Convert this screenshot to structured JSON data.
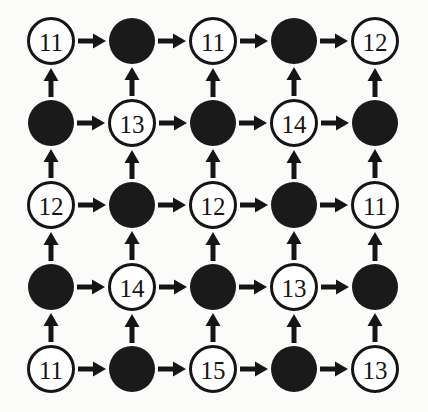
{
  "diagram": {
    "type": "directed-grid-graph",
    "rows": 5,
    "cols": 5,
    "background_color": "#fbfbfa",
    "node_fill_empty_color": "#ffffff",
    "node_fill_filled_color": "#1a1a1a",
    "node_stroke_color": "#151515",
    "arrow_color": "#151515",
    "label_color": "#151515",
    "node_radius": 24,
    "filled_node_radius": 23,
    "node_stroke_width": 3,
    "arrow_shaft_width": 5,
    "col_centers": [
      51,
      132,
      213,
      294,
      375
    ],
    "row_centers": [
      41,
      123,
      205,
      287,
      369
    ],
    "horizontal_arrow_direction": "right",
    "vertical_arrow_direction": "up",
    "grid": [
      [
        {
          "type": "labelled",
          "label": "11"
        },
        {
          "type": "filled",
          "label": ""
        },
        {
          "type": "labelled",
          "label": "11"
        },
        {
          "type": "filled",
          "label": ""
        },
        {
          "type": "labelled",
          "label": "12"
        }
      ],
      [
        {
          "type": "filled",
          "label": ""
        },
        {
          "type": "labelled",
          "label": "13"
        },
        {
          "type": "filled",
          "label": ""
        },
        {
          "type": "labelled",
          "label": "14"
        },
        {
          "type": "filled",
          "label": ""
        }
      ],
      [
        {
          "type": "labelled",
          "label": "12"
        },
        {
          "type": "filled",
          "label": ""
        },
        {
          "type": "labelled",
          "label": "12"
        },
        {
          "type": "filled",
          "label": ""
        },
        {
          "type": "labelled",
          "label": "11"
        }
      ],
      [
        {
          "type": "filled",
          "label": ""
        },
        {
          "type": "labelled",
          "label": "14"
        },
        {
          "type": "filled",
          "label": ""
        },
        {
          "type": "labelled",
          "label": "13"
        },
        {
          "type": "filled",
          "label": ""
        }
      ],
      [
        {
          "type": "labelled",
          "label": "11"
        },
        {
          "type": "filled",
          "label": ""
        },
        {
          "type": "labelled",
          "label": "15"
        },
        {
          "type": "filled",
          "label": ""
        },
        {
          "type": "labelled",
          "label": "13"
        }
      ]
    ]
  }
}
